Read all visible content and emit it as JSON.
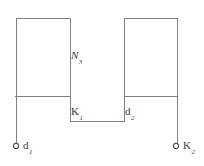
{
  "diagram": {
    "stroke_color": "#808080",
    "text_color": "#3a3a3a",
    "background_color": "#ffffff",
    "labels": {
      "winding": {
        "base": "N",
        "sub": "3"
      },
      "node_left": {
        "base": "K",
        "sub": "1"
      },
      "node_right": {
        "base": "d",
        "sub": "2"
      },
      "terminal_left": {
        "base": "d",
        "sub": "1"
      },
      "terminal_right": {
        "base": "K",
        "sub": "2"
      }
    },
    "terminals": [
      {
        "name": "terminal-left",
        "cx": 16,
        "cy": 146,
        "r": 2.6
      },
      {
        "name": "terminal-right",
        "cx": 176,
        "cy": 146,
        "r": 2.6
      }
    ],
    "paths": {
      "outline": "M 16 146 L 16 18 L 70 18 L 70 121 L 124 121 L 124 18 L 177 18 L 177 146",
      "crossbar_left": "M 15 96 L 70 96",
      "crossbar_right": "M 124 96 L 177 96"
    }
  }
}
